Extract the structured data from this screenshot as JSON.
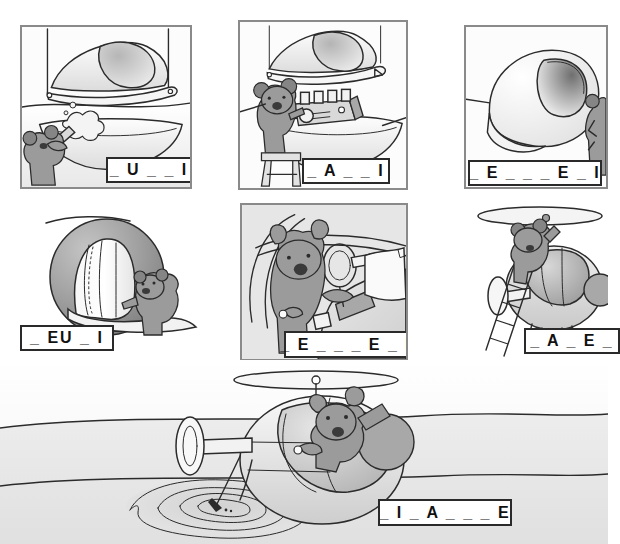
{
  "page": {
    "background_color": "#ffffff",
    "panel_border_color": "#8a8a8a",
    "label_border_color": "#2a2a2a",
    "ink_color": "#2b2b2b",
    "fur_color": "#9b9b9b"
  },
  "panels": [
    {
      "id": "panel-1",
      "position": "top-left",
      "scene": "koala spray-painting the helicopter body shell",
      "label": "_ U _ _ I",
      "framed": true
    },
    {
      "id": "panel-2",
      "position": "top-center",
      "scene": "koala on a stool fitting the engine onto the fuselage",
      "label": "_ A _ _ I",
      "framed": true
    },
    {
      "id": "panel-3",
      "position": "top-right",
      "scene": "koala beside the finished cockpit bubble",
      "label": "_ E _ _ _ E _ I",
      "framed": true
    },
    {
      "id": "panel-4",
      "position": "middle-left",
      "scene": "koala lifting the cockpit canopy glass",
      "label": "_ EU _ I",
      "framed": false
    },
    {
      "id": "panel-5",
      "position": "middle-center",
      "scene": "koala at the controls inside the cockpit holding a map",
      "label": "_ E _ _ _ E _ I",
      "framed": true
    },
    {
      "id": "panel-6",
      "position": "middle-right",
      "scene": "koala on a ladder attaching the main rotor",
      "label": "_ A _ E _",
      "framed": false
    },
    {
      "id": "panel-7",
      "position": "bottom-center",
      "scene": "koala flying the helicopter and fishing into a pond below",
      "label": "_ I _ A _ _ _ E",
      "framed": false
    }
  ]
}
